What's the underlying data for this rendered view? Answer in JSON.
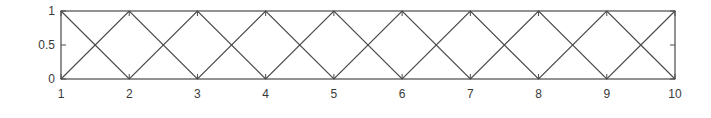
{
  "chart_data": {
    "type": "line",
    "title": "",
    "xlabel": "",
    "ylabel": "",
    "x": [
      1,
      2,
      3,
      4,
      5,
      6,
      7,
      8,
      9,
      10
    ],
    "series": [
      {
        "name": "series-1",
        "values": [
          0,
          1,
          0,
          1,
          0,
          1,
          0,
          1,
          0,
          1
        ],
        "color": "#4a4a4a"
      },
      {
        "name": "series-2",
        "values": [
          1,
          0,
          1,
          0,
          1,
          0,
          1,
          0,
          1,
          0
        ],
        "color": "#4a4a4a"
      }
    ],
    "xlim": [
      1,
      10
    ],
    "ylim": [
      0,
      1
    ],
    "xticks": [
      "1",
      "2",
      "3",
      "4",
      "5",
      "6",
      "7",
      "8",
      "9",
      "10"
    ],
    "yticks": [
      "0",
      "0.5",
      "1"
    ],
    "yticks_values": [
      0,
      0.5,
      1
    ],
    "grid": false,
    "legend": null
  },
  "style": {
    "axis_color": "#4a4a4a",
    "line_color": "#4a4a4a",
    "text_color": "#3a3a3a"
  }
}
